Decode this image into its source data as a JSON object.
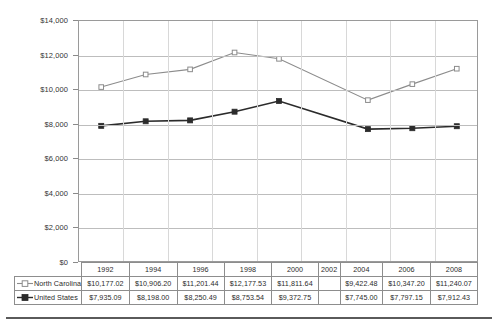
{
  "chart_data": {
    "type": "line",
    "title": "",
    "xlabel": "",
    "ylabel": "",
    "categories": [
      "1992",
      "1994",
      "1996",
      "1998",
      "2000",
      "2002",
      "2004",
      "2006",
      "2008"
    ],
    "ylim": [
      0,
      14000
    ],
    "ytick_values": [
      0,
      2000,
      4000,
      6000,
      8000,
      10000,
      12000,
      14000
    ],
    "ytick_labels": [
      "$0",
      "$2,000",
      "$4,000",
      "$6,000",
      "$8,000",
      "$10,000",
      "$12,000",
      "$14,000"
    ],
    "grid": true,
    "legend_position": "row-headers",
    "series": [
      {
        "name": "North Carolina",
        "color": "#8c8c8c",
        "marker": "open-square",
        "values": [
          10177.02,
          10906.2,
          11201.44,
          12177.53,
          11811.64,
          null,
          9422.48,
          10347.2,
          11240.07
        ],
        "labels": [
          "$10,177.02",
          "$10,906.20",
          "$11,201.44",
          "$12,177.53",
          "$11,811.64",
          "",
          "$9,422.48",
          "$10,347.20",
          "$11,240.07"
        ]
      },
      {
        "name": "United States",
        "color": "#2b2b2b",
        "marker": "filled-square",
        "values": [
          7935.09,
          8198.0,
          8250.49,
          8753.54,
          9372.75,
          null,
          7745.0,
          7797.15,
          7912.43
        ],
        "labels": [
          "$7,935.09",
          "$8,198.00",
          "$8,250.49",
          "$8,753.54",
          "$9,372.75",
          "",
          "$7,745.00",
          "$7,797.15",
          "$7,912.43"
        ]
      }
    ]
  },
  "table": {
    "year_header_label": "",
    "years": [
      "1992",
      "1994",
      "1996",
      "1998",
      "2000",
      "2002",
      "2004",
      "2006",
      "2008"
    ],
    "rows": [
      {
        "label": "North Carolina",
        "marker": "open-square-marker",
        "cells": [
          "$10,177.02",
          "$10,906.20",
          "$11,201.44",
          "$12,177.53",
          "$11,811.64",
          "",
          "$9,422.48",
          "$10,347.20",
          "$11,240.07"
        ]
      },
      {
        "label": "United States",
        "marker": "filled-square-marker",
        "cells": [
          "$7,935.09",
          "$8,198.00",
          "$8,250.49",
          "$8,753.54",
          "$9,372.75",
          "",
          "$7,745.00",
          "$7,797.15",
          "$7,912.43"
        ]
      }
    ]
  },
  "colors": {
    "north_carolina": "#8c8c8c",
    "united_states": "#2b2b2b",
    "gridline": "#bdbdbd",
    "border": "#9a9a9a"
  }
}
